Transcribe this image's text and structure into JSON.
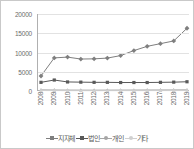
{
  "chart_data": {
    "type": "line",
    "title": "",
    "xlabel": "",
    "ylabel": "",
    "categories": [
      "2008",
      "2009",
      "2010",
      "2011",
      "2012",
      "2013",
      "2014",
      "2015",
      "2016",
      "2017",
      "2018",
      "2019"
    ],
    "ylim": [
      0,
      20000
    ],
    "yticks": [
      "0",
      "5000",
      "10000",
      "15000",
      "20000"
    ],
    "ytick_values": [
      0,
      5000,
      10000,
      15000,
      20000
    ],
    "grid": true,
    "legend_position": "bottom",
    "series": [
      {
        "name": "지자체",
        "color": "#7f7f7f",
        "marker": "diamond",
        "values": [
          3900,
          8600,
          8800,
          8300,
          8350,
          8550,
          9200,
          10500,
          11600,
          12300,
          13000,
          16300
        ]
      },
      {
        "name": "법인",
        "color": "#595959",
        "marker": "square",
        "values": [
          2250,
          2850,
          2350,
          2300,
          2250,
          2250,
          2200,
          2200,
          2200,
          2250,
          2300,
          2400
        ]
      },
      {
        "name": "개인",
        "color": "#a6a6a6",
        "marker": "triangle",
        "values": [
          300,
          260,
          240,
          230,
          220,
          230,
          240,
          250,
          260,
          270,
          280,
          300
        ]
      },
      {
        "name": "기타",
        "color": "#d0d0d0",
        "marker": "dot",
        "values": [
          120,
          110,
          100,
          95,
          90,
          95,
          100,
          100,
          105,
          110,
          115,
          120
        ]
      }
    ]
  },
  "frame": {
    "border_color": "#c9c9c9",
    "background": "#ffffff",
    "axis_color": "#b0b0b0",
    "gridline_color": "#e2e2e2",
    "tick_label_color": "#6b6b6b",
    "legend_label_color": "#5a5a5a"
  }
}
